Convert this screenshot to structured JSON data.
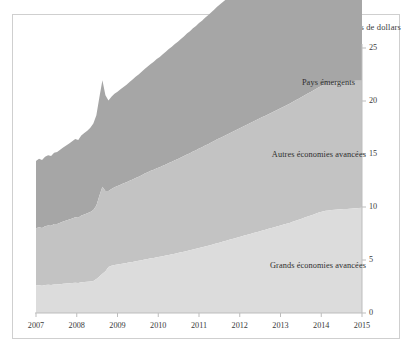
{
  "chart_data": {
    "type": "area",
    "stacked": true,
    "title": "Milliers de milliards de dollars",
    "xlabel": "",
    "ylabel": "",
    "xlim": [
      2007,
      2015
    ],
    "ylim": [
      0,
      25
    ],
    "yticks": [
      0,
      5,
      10,
      15,
      20,
      25
    ],
    "xticks": [
      2007,
      2008,
      2009,
      2010,
      2011,
      2012,
      2013,
      2014,
      2015
    ],
    "xtick_labels": [
      "2007",
      "2008",
      "2009",
      "2010",
      "2011",
      "2012",
      "2013",
      "2014",
      "2015"
    ],
    "ytick_labels": [
      "0",
      "5",
      "10",
      "15",
      "20",
      "25"
    ],
    "grid": false,
    "y_axis_position": "right",
    "legend": "inline-labels",
    "colors": {
      "major_advanced": "#dcdcdc",
      "other_advanced": "#c3c3c3",
      "emerging": "#a6a6a6",
      "axis": "#bdbdbd",
      "text": "#2e2e2e",
      "frame": "#cfcfcf",
      "background": "#ffffff"
    },
    "series": [
      {
        "name": "Grands économies avancées",
        "key": "major_advanced",
        "color": "#dcdcdc",
        "label_position": "inside-bottom",
        "values": [
          2.6,
          2.62,
          2.58,
          2.63,
          2.66,
          2.64,
          2.7,
          2.68,
          2.72,
          2.75,
          2.78,
          2.8,
          2.82,
          2.86,
          2.84,
          2.9,
          2.92,
          2.95,
          2.98,
          3.02,
          3.2,
          3.45,
          3.7,
          3.95,
          4.35,
          4.45,
          4.52,
          4.58,
          4.62,
          4.68,
          4.72,
          4.78,
          4.82,
          4.88,
          4.92,
          4.98,
          5.05,
          5.1,
          5.16,
          5.2,
          5.26,
          5.3,
          5.36,
          5.42,
          5.48,
          5.54,
          5.6,
          5.66,
          5.72,
          5.78,
          5.86,
          5.92,
          6.0,
          6.06,
          6.14,
          6.2,
          6.28,
          6.34,
          6.42,
          6.5,
          6.58,
          6.66,
          6.74,
          6.82,
          6.9,
          6.98,
          7.06,
          7.14,
          7.22,
          7.3,
          7.38,
          7.46,
          7.54,
          7.62,
          7.7,
          7.78,
          7.86,
          7.94,
          8.02,
          8.1,
          8.18,
          8.26,
          8.34,
          8.42,
          8.5,
          8.6,
          8.7,
          8.8,
          8.9,
          9.0,
          9.1,
          9.2,
          9.3,
          9.4,
          9.5,
          9.58,
          9.64,
          9.68,
          9.72,
          9.74,
          9.76,
          9.78,
          9.8,
          9.82,
          9.84,
          9.86,
          9.88,
          9.9,
          9.92
        ]
      },
      {
        "name": "Autres économies avancées",
        "key": "other_advanced",
        "color": "#c3c3c3",
        "label_position": "inside-middle",
        "values": [
          5.4,
          5.48,
          5.45,
          5.55,
          5.6,
          5.58,
          5.7,
          5.72,
          5.8,
          5.88,
          5.95,
          6.02,
          6.1,
          6.18,
          6.15,
          6.3,
          6.38,
          6.45,
          6.55,
          6.7,
          6.95,
          7.6,
          8.2,
          7.55,
          7.15,
          7.25,
          7.35,
          7.4,
          7.48,
          7.55,
          7.62,
          7.7,
          7.78,
          7.86,
          7.94,
          8.02,
          8.1,
          8.18,
          8.26,
          8.32,
          8.4,
          8.46,
          8.54,
          8.6,
          8.68,
          8.74,
          8.82,
          8.88,
          8.96,
          9.02,
          9.1,
          9.16,
          9.24,
          9.3,
          9.38,
          9.44,
          9.52,
          9.58,
          9.66,
          9.72,
          9.8,
          9.86,
          9.92,
          9.98,
          10.04,
          10.1,
          10.16,
          10.22,
          10.28,
          10.34,
          10.4,
          10.46,
          10.52,
          10.58,
          10.64,
          10.7,
          10.76,
          10.82,
          10.88,
          10.94,
          11.0,
          11.06,
          11.12,
          11.18,
          11.24,
          11.3,
          11.36,
          11.42,
          11.48,
          11.54,
          11.6,
          11.66,
          11.72,
          11.78,
          11.84,
          11.9,
          11.94,
          11.96,
          11.98,
          12.0,
          12.02,
          12.04,
          12.06,
          12.05,
          12.04,
          12.03,
          12.02,
          12.01,
          12.0
        ]
      },
      {
        "name": "Pays émergents",
        "key": "emerging",
        "color": "#a6a6a6",
        "label_position": "inside-top",
        "values": [
          6.35,
          6.45,
          6.4,
          6.55,
          6.62,
          6.58,
          6.72,
          6.78,
          6.88,
          6.98,
          7.08,
          7.18,
          7.28,
          7.38,
          7.32,
          7.55,
          7.68,
          7.8,
          7.95,
          8.15,
          8.5,
          9.3,
          10.05,
          9.05,
          8.55,
          8.7,
          8.82,
          8.9,
          9.0,
          9.1,
          9.2,
          9.32,
          9.42,
          9.54,
          9.64,
          9.76,
          9.86,
          9.98,
          10.08,
          10.18,
          10.3,
          10.4,
          10.52,
          10.62,
          10.74,
          10.84,
          10.96,
          11.06,
          11.18,
          11.28,
          11.4,
          11.5,
          11.62,
          11.72,
          11.84,
          11.94,
          12.06,
          12.16,
          12.28,
          12.38,
          12.5,
          12.6,
          12.7,
          12.8,
          12.92,
          13.02,
          13.12,
          13.22,
          13.34,
          13.44,
          13.54,
          13.64,
          13.76,
          13.86,
          13.96,
          14.06,
          14.18,
          14.28,
          14.38,
          14.48,
          14.6,
          14.7,
          14.8,
          14.9,
          15.02,
          15.12,
          15.22,
          15.32,
          15.44,
          15.54,
          15.64,
          15.74,
          15.86,
          15.96,
          16.06,
          16.16,
          16.22,
          16.26,
          16.3,
          16.32,
          16.36,
          16.38,
          16.4,
          16.36,
          16.32,
          16.28,
          16.24,
          16.2,
          16.16
        ]
      }
    ]
  },
  "labels": {
    "emerging": "Pays émergents",
    "other_advanced": "Autres économies avancées",
    "major_advanced": "Grands économies avancées"
  }
}
